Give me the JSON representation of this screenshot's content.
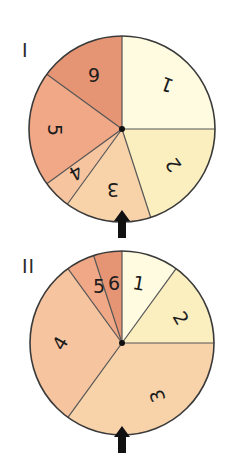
{
  "figure": {
    "width": 233,
    "height": 458,
    "stroke_color": "#3a3a3a",
    "divider_color": "#555555",
    "arrow_color": "#111111"
  },
  "chart_data": [
    {
      "type": "pie",
      "title": "I",
      "center": [
        122,
        129
      ],
      "radius": 93,
      "start_angle_deg": 270,
      "direction": "clockwise",
      "slices": [
        {
          "label": "1",
          "value": 5,
          "degrees": 90,
          "color": "#fefbe0",
          "label_pos": [
            167,
            85
          ],
          "label_rotate": 200
        },
        {
          "label": "2",
          "value": 4,
          "degrees": 72,
          "color": "#fbefc0",
          "label_pos": [
            173,
            165
          ],
          "label_rotate": 235
        },
        {
          "label": "3",
          "value": 3,
          "degrees": 54,
          "color": "#f8d3aa",
          "label_pos": [
            113,
            190
          ],
          "label_rotate": 180
        },
        {
          "label": "4",
          "value": 1,
          "degrees": 18,
          "color": "#f6c5a0",
          "label_pos": [
            76,
            173
          ],
          "label_rotate": 150
        },
        {
          "label": "5",
          "value": 4,
          "degrees": 72,
          "color": "#f1a886",
          "label_pos": [
            55,
            130
          ],
          "label_rotate": 90
        },
        {
          "label": "6",
          "value": 3,
          "degrees": 54,
          "color": "#e59574",
          "label_pos": [
            94,
            75
          ],
          "label_rotate": 180
        }
      ],
      "arrow": {
        "x": 122,
        "tip_y": 210,
        "base_y": 238
      }
    },
    {
      "type": "pie",
      "title": "II",
      "center": [
        122,
        343
      ],
      "radius": 92,
      "start_angle_deg": 270,
      "direction": "clockwise",
      "slices": [
        {
          "label": "1",
          "value": 2,
          "degrees": 36,
          "color": "#fefbe0",
          "label_pos": [
            139,
            283
          ],
          "label_rotate": 10
        },
        {
          "label": "2",
          "value": 3,
          "degrees": 54,
          "color": "#fbefc0",
          "label_pos": [
            181,
            318
          ],
          "label_rotate": 60
        },
        {
          "label": "3",
          "value": 7,
          "degrees": 126,
          "color": "#f8d3aa",
          "label_pos": [
            157,
            396
          ],
          "label_rotate": 250
        },
        {
          "label": "4",
          "value": 6,
          "degrees": 108,
          "color": "#f6c5a0",
          "label_pos": [
            60,
            343
          ],
          "label_rotate": 300
        },
        {
          "label": "5",
          "value": 1,
          "degrees": 18,
          "color": "#f1a886",
          "label_pos": [
            99,
            286
          ],
          "label_rotate": 0
        },
        {
          "label": "6",
          "value": 1,
          "degrees": 18,
          "color": "#e59574",
          "label_pos": [
            114,
            283
          ],
          "label_rotate": 0
        }
      ],
      "arrow": {
        "x": 122,
        "tip_y": 426,
        "base_y": 453
      }
    }
  ],
  "labels": {
    "wheel_1": "I",
    "wheel_2": "II"
  }
}
